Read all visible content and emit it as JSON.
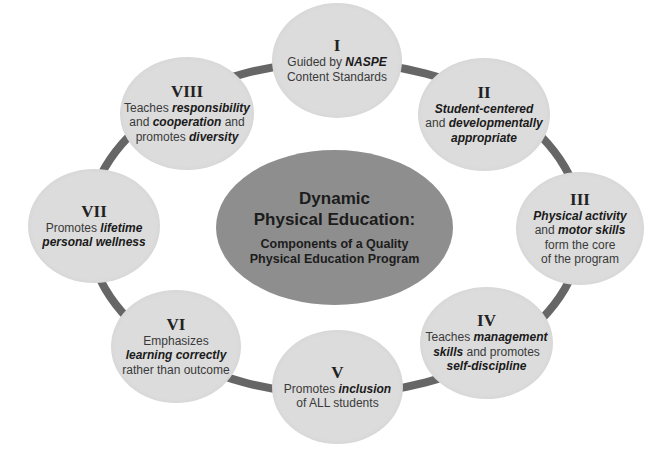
{
  "diagram": {
    "type": "hub-and-ring",
    "center": {
      "title_lines": [
        "Dynamic",
        "Physical Education:"
      ],
      "subtitle_lines": [
        "Components of a Quality",
        "Physical Education Program"
      ]
    },
    "nodes": [
      {
        "numeral": "I",
        "lines": [
          [
            {
              "t": "Guided by ",
              "em": false
            },
            {
              "t": "NASPE",
              "em": true
            }
          ],
          [
            {
              "t": "Content Standards",
              "em": false
            }
          ]
        ]
      },
      {
        "numeral": "II",
        "lines": [
          [
            {
              "t": "Student-centered",
              "em": true
            }
          ],
          [
            {
              "t": "and ",
              "em": false
            },
            {
              "t": "developmentally",
              "em": true
            }
          ],
          [
            {
              "t": "appropriate",
              "em": true
            }
          ]
        ]
      },
      {
        "numeral": "III",
        "lines": [
          [
            {
              "t": "Physical activity",
              "em": true
            }
          ],
          [
            {
              "t": "and ",
              "em": false
            },
            {
              "t": "motor skills",
              "em": true
            }
          ],
          [
            {
              "t": "form the core",
              "em": false
            }
          ],
          [
            {
              "t": "of the program",
              "em": false
            }
          ]
        ]
      },
      {
        "numeral": "IV",
        "lines": [
          [
            {
              "t": "Teaches ",
              "em": false
            },
            {
              "t": "management",
              "em": true
            }
          ],
          [
            {
              "t": "skills",
              "em": true
            },
            {
              "t": " and promotes",
              "em": false
            }
          ],
          [
            {
              "t": "self-discipline",
              "em": true
            }
          ]
        ]
      },
      {
        "numeral": "V",
        "lines": [
          [
            {
              "t": "Promotes ",
              "em": false
            },
            {
              "t": "inclusion",
              "em": true
            }
          ],
          [
            {
              "t": "of ALL students",
              "em": false
            }
          ]
        ]
      },
      {
        "numeral": "VI",
        "lines": [
          [
            {
              "t": "Emphasizes",
              "em": false
            }
          ],
          [
            {
              "t": "learning correctly",
              "em": true
            }
          ],
          [
            {
              "t": "rather than outcome",
              "em": false
            }
          ]
        ]
      },
      {
        "numeral": "VII",
        "lines": [
          [
            {
              "t": "Promotes ",
              "em": false
            },
            {
              "t": "lifetime",
              "em": true
            }
          ],
          [
            {
              "t": "personal wellness",
              "em": true
            }
          ]
        ]
      },
      {
        "numeral": "VIII",
        "lines": [
          [
            {
              "t": "Teaches ",
              "em": false
            },
            {
              "t": "responsibility",
              "em": true
            }
          ],
          [
            {
              "t": "and ",
              "em": false
            },
            {
              "t": "cooperation",
              "em": true
            },
            {
              "t": " and",
              "em": false
            }
          ],
          [
            {
              "t": "promotes ",
              "em": false
            },
            {
              "t": "diversity",
              "em": true
            }
          ]
        ]
      }
    ],
    "colors": {
      "node_fill": "#dcdcdc",
      "hub_fill": "#8e8e8e",
      "ring_stroke": "#666666",
      "background": "#ffffff"
    }
  }
}
